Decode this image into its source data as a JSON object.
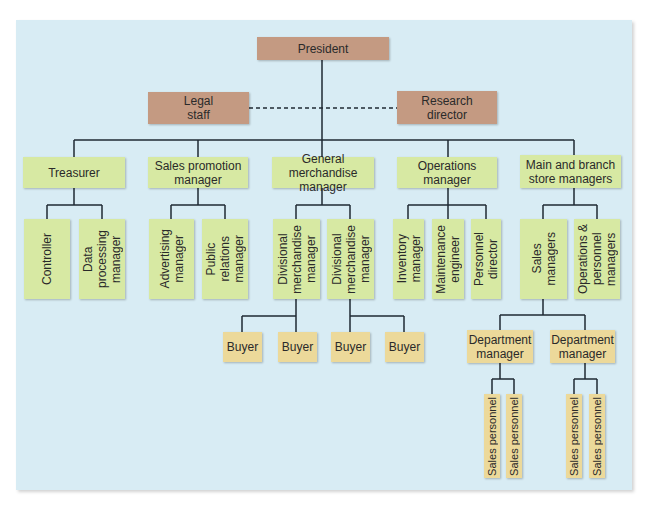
{
  "colors": {
    "background_panel": "#d8ecf4",
    "executive_box": "#c49a82",
    "department_box": "#d7e9a3",
    "staff_box": "#ecd99a",
    "connector": "#1f2a33"
  },
  "chart": {
    "president": "President",
    "advisory": {
      "legal_staff": "Legal\nstaff",
      "research_director": "Research\ndirector",
      "relation": "dashed advisory line"
    },
    "divisions": [
      {
        "label": "Treasurer",
        "children": [
          "Controller",
          "Data\nprocessing\nmanager"
        ]
      },
      {
        "label": "Sales promotion\nmanager",
        "children": [
          "Advertising\nmanager",
          "Public\nrelations\nmanager"
        ]
      },
      {
        "label": "General merchandise\nmanager",
        "children": [
          "Divisional\nmerchandise\nmanager",
          "Divisional\nmerchandise\nmanager"
        ],
        "grandchildren": [
          "Buyer",
          "Buyer",
          "Buyer",
          "Buyer"
        ]
      },
      {
        "label": "Operations\nmanager",
        "children": [
          "Inventory\nmanager",
          "Maintenance\nengineer",
          "Personnel\ndirector"
        ]
      },
      {
        "label": "Main and branch\nstore managers",
        "children": [
          "Sales\nmanagers",
          "Operations &\npersonnel\nmanagers"
        ],
        "grandchildren": [
          "Department\nmanager",
          "Department\nmanager"
        ],
        "great_grandchildren": [
          "Sales personnel",
          "Sales personnel",
          "Sales personnel",
          "Sales personnel"
        ]
      }
    ]
  }
}
